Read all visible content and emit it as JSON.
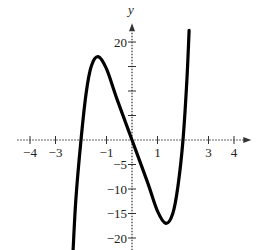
{
  "chart_data": {
    "type": "line",
    "title": "",
    "xlabel": "",
    "ylabel": "y",
    "xlim": [
      -4.5,
      4.6
    ],
    "ylim": [
      -22.5,
      23
    ],
    "grid": false,
    "x_ticks": [
      -4,
      -3,
      -2,
      -1,
      1,
      2,
      3,
      4
    ],
    "x_tick_labels": [
      {
        "value": -4,
        "label": "−4"
      },
      {
        "value": -3,
        "label": "−3"
      },
      {
        "value": -1,
        "label": "−1"
      },
      {
        "value": 1,
        "label": "1"
      },
      {
        "value": 3,
        "label": "3"
      },
      {
        "value": 4,
        "label": "4"
      }
    ],
    "y_ticks": [
      -20,
      -15,
      -10,
      -5,
      5,
      10,
      15,
      20
    ],
    "y_tick_labels": [
      {
        "value": 20,
        "label": "20"
      },
      {
        "value": -5,
        "label": "−5"
      },
      {
        "value": -10,
        "label": "−10"
      },
      {
        "value": -15,
        "label": "−15"
      },
      {
        "value": -20,
        "label": "−20"
      }
    ],
    "series": [
      {
        "name": "f(x)",
        "color": "#000000",
        "points": [
          [
            -2.31,
            -22.5
          ],
          [
            -2.2,
            -12
          ],
          [
            -2.0,
            0
          ],
          [
            -1.8,
            9.5
          ],
          [
            -1.6,
            15
          ],
          [
            -1.33,
            17
          ],
          [
            -1.0,
            14.5
          ],
          [
            -0.6,
            8.5
          ],
          [
            0,
            0
          ],
          [
            0.6,
            -8.5
          ],
          [
            1.0,
            -14.5
          ],
          [
            1.33,
            -17
          ],
          [
            1.6,
            -15
          ],
          [
            1.8,
            -9.5
          ],
          [
            2.0,
            0
          ],
          [
            2.15,
            12
          ],
          [
            2.24,
            22.4
          ]
        ]
      }
    ]
  }
}
